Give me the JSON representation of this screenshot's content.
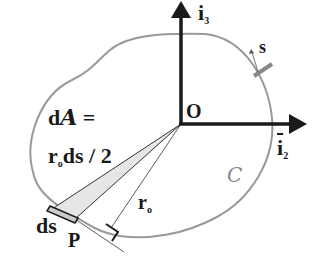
{
  "diagram": {
    "origin_label": "O",
    "point_label": "P",
    "axis_vertical": {
      "symbol": "i",
      "subscript": "3"
    },
    "axis_horizontal": {
      "symbol": "i",
      "subscript": "2"
    },
    "arc_param_label": "s",
    "curve_label": "C",
    "radius_label": {
      "symbol": "r",
      "subscript": "o"
    },
    "element_label": "ds",
    "area_formula": {
      "line1_prefix": "d",
      "line1_symbol": "A",
      "line1_suffix": " =",
      "line2_symbol": "r",
      "line2_subscript": "o",
      "line2_suffix": "ds / 2"
    },
    "colors": {
      "curve": "#999999",
      "axes": "#1a1a1a",
      "wedge_fill": "#e6e6e6",
      "element_fill": "#cccccc",
      "marker": "#888888"
    }
  }
}
